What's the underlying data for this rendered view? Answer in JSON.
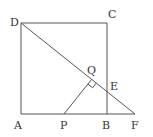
{
  "diagram": {
    "type": "geometry",
    "points": {
      "A": {
        "label": "A",
        "x": 21,
        "y": 114
      },
      "B": {
        "label": "B",
        "x": 107,
        "y": 114
      },
      "C": {
        "label": "C",
        "x": 107,
        "y": 23
      },
      "D": {
        "label": "D",
        "x": 21,
        "y": 23
      },
      "E": {
        "label": "E",
        "x": 107,
        "y": 91.6
      },
      "F": {
        "label": "F",
        "x": 135,
        "y": 114
      },
      "P": {
        "label": "P",
        "x": 64,
        "y": 114
      },
      "Q": {
        "label": "Q",
        "x": 91.6,
        "y": 79.4
      }
    },
    "segments": [
      "AB",
      "BC",
      "CD",
      "DA",
      "BF",
      "DF",
      "PQ"
    ],
    "right_angle_marks": [
      "PQD"
    ],
    "colors": {
      "stroke": "#555555",
      "text": "#333333",
      "background": "#ffffff"
    }
  }
}
